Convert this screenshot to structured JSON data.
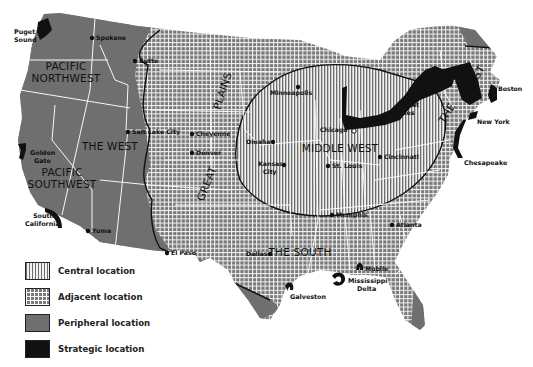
{
  "map": {
    "regions": {
      "pacific_northwest": [
        "PACIFIC",
        "NORTHWEST"
      ],
      "the_west": "THE WEST",
      "pacific_southwest": [
        "PACIFIC",
        "SOUTHWEST"
      ],
      "great_plains": [
        "GREAT",
        "PLAINS"
      ],
      "middle_west": "MIDDLE WEST",
      "the_south": "THE SOUTH",
      "the_east": [
        "THE",
        "EAST"
      ]
    },
    "cities": {
      "spokane": "Spokane",
      "butte": "Butte",
      "salt_lake_city": "Salt Lake City",
      "cheyenne": "Cheyenne",
      "denver": "Denver",
      "minneapolis": "Minneapolis",
      "omaha": "Omaha",
      "kansas_city": [
        "Kansas",
        "City"
      ],
      "chicago": "Chicago",
      "st_louis": "St. Louis",
      "cincinnati": "Cincinnati",
      "memphis": "Memphis",
      "atlanta": "Atlanta",
      "dallas": "Dallas",
      "el_paso": "El Paso",
      "yuma": "Yuma",
      "boston": "Boston",
      "new_york": "New York",
      "mobile": "Mobile"
    },
    "features": {
      "puget_sound": [
        "Puget",
        "Sound"
      ],
      "golden_gate": [
        "Golden",
        "Gate"
      ],
      "south_california": [
        "South",
        "California"
      ],
      "great_lakes": [
        "Great",
        "Lakes"
      ],
      "chesapeake": "Chesapeake",
      "galveston": "Galveston",
      "mississippi_delta": [
        "Mississippi",
        "Delta"
      ]
    }
  },
  "legend": {
    "items": [
      {
        "key": "central",
        "label": "Central location",
        "pattern": "vertical-lines"
      },
      {
        "key": "adjacent",
        "label": "Adjacent location",
        "pattern": "grid"
      },
      {
        "key": "peripheral",
        "label": "Peripheral location",
        "pattern": "solid-gray"
      },
      {
        "key": "strategic",
        "label": "Strategic location",
        "pattern": "solid-black"
      }
    ]
  },
  "colors": {
    "peripheral": "#6f6f6f",
    "strategic": "#111111",
    "adjacent_base": "#7a7a7a",
    "central_line": "#6e6e6e",
    "border": "#ffffff"
  }
}
